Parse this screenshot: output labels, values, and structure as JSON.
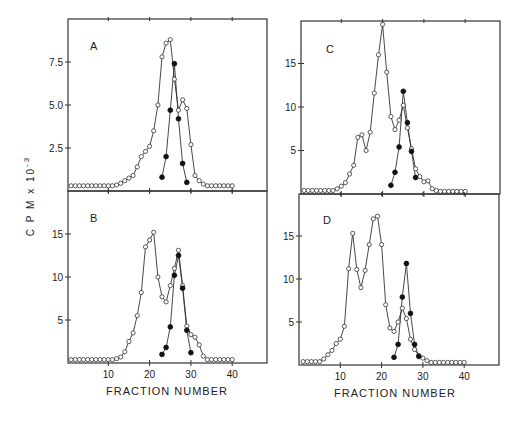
{
  "figure": {
    "ylabel": "C P M  x  10",
    "ylabel_exp": "-3",
    "xlabel": "FRACTION   NUMBER"
  },
  "chart_data": [
    {
      "type": "line",
      "panel": "A",
      "xlabel": "",
      "ylabel": "CPM x 10^-3",
      "xlim": [
        0,
        48
      ],
      "ylim": [
        0,
        10
      ],
      "yticks": [
        2.5,
        5.0,
        7.5
      ],
      "ytick_labels": [
        "2.5",
        "5.0",
        "7.5"
      ],
      "xticks": [
        10,
        20,
        30,
        40
      ],
      "xtick_labels": [],
      "series": [
        {
          "name": "open circles",
          "marker": "open",
          "x": [
            1,
            2,
            3,
            4,
            5,
            6,
            7,
            8,
            9,
            10,
            11,
            12,
            13,
            14,
            15,
            16,
            17,
            18,
            19,
            20,
            21,
            22,
            23,
            24,
            25,
            26,
            27,
            28,
            29,
            30,
            31,
            32,
            33,
            34,
            35,
            36,
            37,
            38,
            39,
            40
          ],
          "y": [
            0.3,
            0.3,
            0.3,
            0.3,
            0.3,
            0.3,
            0.3,
            0.3,
            0.3,
            0.3,
            0.3,
            0.35,
            0.45,
            0.6,
            0.75,
            0.9,
            1.4,
            2.0,
            2.3,
            2.6,
            3.5,
            5.0,
            7.8,
            8.6,
            8.8,
            6.5,
            4.7,
            5.3,
            4.8,
            2.7,
            0.9,
            0.6,
            0.4,
            0.3,
            0.3,
            0.3,
            0.3,
            0.3,
            0.3,
            0.3
          ]
        },
        {
          "name": "filled circles",
          "marker": "filled",
          "x": [
            23,
            24,
            25,
            26,
            27,
            28,
            29
          ],
          "y": [
            0.8,
            2.0,
            4.7,
            7.4,
            4.2,
            1.6,
            0.5
          ]
        }
      ]
    },
    {
      "type": "line",
      "panel": "B",
      "xlabel": "FRACTION NUMBER",
      "ylabel": "CPM x 10^-3",
      "xlim": [
        0,
        48
      ],
      "ylim": [
        0,
        20
      ],
      "yticks": [
        5,
        10,
        15
      ],
      "ytick_labels": [
        "5",
        "10",
        "15"
      ],
      "xticks": [
        10,
        20,
        30,
        40
      ],
      "xtick_labels": [
        "10",
        "20",
        "30",
        "40"
      ],
      "series": [
        {
          "name": "open circles",
          "marker": "open",
          "x": [
            1,
            2,
            3,
            4,
            5,
            6,
            7,
            8,
            9,
            10,
            11,
            12,
            13,
            14,
            15,
            16,
            17,
            18,
            19,
            20,
            21,
            22,
            23,
            24,
            25,
            26,
            27,
            28,
            29,
            30,
            31,
            32,
            33,
            34,
            35,
            36,
            37,
            38,
            39,
            40
          ],
          "y": [
            0.4,
            0.4,
            0.4,
            0.4,
            0.4,
            0.4,
            0.4,
            0.4,
            0.4,
            0.4,
            0.4,
            0.5,
            0.7,
            1.3,
            2.5,
            3.5,
            5.5,
            8.2,
            13.5,
            14.3,
            15.2,
            10.0,
            7.7,
            7.1,
            9.0,
            11.0,
            13.1,
            9.0,
            4.3,
            3.3,
            3.0,
            2.1,
            0.8,
            0.4,
            0.4,
            0.4,
            0.4,
            0.4,
            0.4,
            0.4
          ]
        },
        {
          "name": "filled circles",
          "marker": "filled",
          "x": [
            23,
            24,
            25,
            26,
            27,
            28,
            29,
            30
          ],
          "y": [
            1.0,
            1.8,
            4.2,
            10.2,
            12.5,
            8.7,
            3.8,
            1.2
          ]
        }
      ]
    },
    {
      "type": "line",
      "panel": "C",
      "xlabel": "",
      "ylabel": "CPM x 10^-3",
      "xlim": [
        0,
        48
      ],
      "ylim": [
        0,
        20
      ],
      "yticks": [
        5,
        10,
        15
      ],
      "ytick_labels": [
        "5",
        "10",
        "15"
      ],
      "xticks": [
        10,
        20,
        30,
        40
      ],
      "xtick_labels": [],
      "series": [
        {
          "name": "open circles",
          "marker": "open",
          "x": [
            1,
            2,
            3,
            4,
            5,
            6,
            7,
            8,
            9,
            10,
            11,
            12,
            13,
            14,
            15,
            16,
            17,
            18,
            19,
            20,
            21,
            22,
            23,
            24,
            25,
            26,
            27,
            28,
            29,
            30,
            31,
            32,
            33,
            34,
            35,
            36,
            37,
            38,
            39,
            40
          ],
          "y": [
            0.4,
            0.4,
            0.4,
            0.4,
            0.4,
            0.4,
            0.4,
            0.4,
            0.6,
            0.9,
            1.3,
            2.3,
            3.3,
            6.5,
            6.8,
            5.0,
            7.1,
            11.6,
            16.0,
            19.5,
            14.0,
            8.9,
            7.4,
            8.5,
            10.2,
            7.6,
            5.2,
            2.9,
            2.0,
            1.4,
            1.5,
            0.6,
            0.4,
            0.3,
            0.3,
            0.3,
            0.3,
            0.3,
            0.3,
            0.3
          ]
        },
        {
          "name": "filled circles",
          "marker": "filled",
          "x": [
            22,
            23,
            24,
            25,
            26,
            27,
            28
          ],
          "y": [
            1.0,
            2.5,
            5.4,
            11.8,
            8.2,
            4.9,
            1.9
          ]
        }
      ]
    },
    {
      "type": "line",
      "panel": "D",
      "xlabel": "FRACTION NUMBER",
      "ylabel": "CPM x 10^-3",
      "xlim": [
        0,
        48
      ],
      "ylim": [
        0,
        20
      ],
      "yticks": [
        5,
        10,
        15
      ],
      "ytick_labels": [
        "5",
        "10",
        "15"
      ],
      "xticks": [
        10,
        20,
        30,
        40
      ],
      "xtick_labels": [
        "10",
        "20",
        "30",
        "40"
      ],
      "series": [
        {
          "name": "open circles",
          "marker": "open",
          "x": [
            1,
            2,
            3,
            4,
            5,
            6,
            7,
            8,
            9,
            10,
            11,
            12,
            13,
            14,
            15,
            16,
            17,
            18,
            19,
            20,
            21,
            22,
            23,
            24,
            25,
            26,
            27,
            28,
            29,
            30,
            31,
            32,
            33,
            34,
            35,
            36,
            37,
            38,
            39,
            40
          ],
          "y": [
            0.4,
            0.4,
            0.4,
            0.4,
            0.4,
            0.7,
            1.2,
            1.7,
            2.5,
            3.0,
            4.5,
            11.2,
            15.3,
            11.1,
            9.0,
            11.0,
            14.0,
            17.0,
            17.3,
            14.0,
            7.0,
            4.3,
            3.9,
            5.0,
            6.6,
            5.4,
            3.0,
            1.8,
            1.1,
            0.8,
            0.5,
            0.3,
            0.3,
            0.3,
            0.3,
            0.3,
            0.3,
            0.3,
            0.3,
            0.3
          ]
        },
        {
          "name": "filled circles",
          "marker": "filled",
          "x": [
            23,
            24,
            25,
            26,
            27,
            28,
            29
          ],
          "y": [
            0.9,
            2.4,
            7.9,
            11.8,
            6.0,
            2.4,
            1.0
          ]
        }
      ]
    }
  ],
  "layout": [
    {
      "panel": "A",
      "left": 68,
      "right": 267,
      "top": 19,
      "bottom": 191,
      "x0": 67,
      "pxPerX": 4.13,
      "y0": 191,
      "pxPerY": 17.2,
      "letterX": 90,
      "letterY": 50
    },
    {
      "panel": "B",
      "left": 68,
      "right": 267,
      "top": 191,
      "bottom": 363,
      "x0": 67,
      "pxPerX": 4.13,
      "y0": 363,
      "pxPerY": 8.6,
      "letterX": 90,
      "letterY": 222
    },
    {
      "panel": "C",
      "left": 301,
      "right": 500,
      "top": 21,
      "bottom": 194,
      "x0": 300,
      "pxPerX": 4.13,
      "y0": 194,
      "pxPerY": 8.7,
      "letterX": 326,
      "letterY": 53
    },
    {
      "panel": "D",
      "left": 299,
      "right": 499,
      "top": 194,
      "bottom": 365,
      "x0": 299,
      "pxPerX": 4.13,
      "y0": 365,
      "pxPerY": 8.6,
      "letterX": 323,
      "letterY": 224
    }
  ],
  "xlabels": [
    {
      "x": 167,
      "y": 395
    },
    {
      "x": 395,
      "y": 397
    }
  ]
}
